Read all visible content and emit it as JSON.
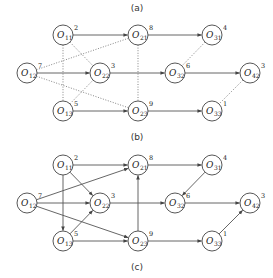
{
  "captions": {
    "a": "(a)",
    "b": "(b)",
    "c": "(c)"
  },
  "nodes": [
    {
      "id": "O11",
      "letter": "O",
      "sub": "11",
      "weight": "2",
      "x": 63,
      "y": 0
    },
    {
      "id": "O12",
      "letter": "O",
      "sub": "12",
      "weight": "7",
      "x": 27,
      "y": 38
    },
    {
      "id": "O13",
      "letter": "O",
      "sub": "13",
      "weight": "5",
      "x": 63,
      "y": 76
    },
    {
      "id": "O21",
      "letter": "O",
      "sub": "21",
      "weight": "8",
      "x": 138,
      "y": 0
    },
    {
      "id": "O22",
      "letter": "O",
      "sub": "22",
      "weight": "3",
      "x": 100,
      "y": 38
    },
    {
      "id": "O23",
      "letter": "O",
      "sub": "23",
      "weight": "9",
      "x": 138,
      "y": 76
    },
    {
      "id": "O31",
      "letter": "O",
      "sub": "31",
      "weight": "4",
      "x": 212,
      "y": 0
    },
    {
      "id": "O32",
      "letter": "O",
      "sub": "32",
      "weight": "6",
      "x": 175,
      "y": 38
    },
    {
      "id": "O33",
      "letter": "O",
      "sub": "33",
      "weight": "1",
      "x": 212,
      "y": 76
    },
    {
      "id": "O42",
      "letter": "O",
      "sub": "42",
      "weight": "3",
      "x": 250,
      "y": 38
    }
  ],
  "diagram_b": {
    "solid_edges": [
      [
        "O11",
        "O21"
      ],
      [
        "O21",
        "O31"
      ],
      [
        "O12",
        "O22"
      ],
      [
        "O22",
        "O32"
      ],
      [
        "O32",
        "O42"
      ],
      [
        "O13",
        "O23"
      ],
      [
        "O23",
        "O33"
      ]
    ],
    "dotted_edges": [
      [
        "O11",
        "O13"
      ],
      [
        "O11",
        "O22"
      ],
      [
        "O12",
        "O21"
      ],
      [
        "O12",
        "O23"
      ],
      [
        "O13",
        "O22"
      ],
      [
        "O21",
        "O23"
      ],
      [
        "O31",
        "O32"
      ],
      [
        "O42",
        "O33"
      ]
    ]
  },
  "diagram_c": {
    "solid_edges": [
      [
        "O11",
        "O21"
      ],
      [
        "O11",
        "O22"
      ],
      [
        "O11",
        "O13"
      ],
      [
        "O12",
        "O21"
      ],
      [
        "O12",
        "O22"
      ],
      [
        "O12",
        "O23"
      ],
      [
        "O13",
        "O22"
      ],
      [
        "O13",
        "O23"
      ],
      [
        "O23",
        "O21"
      ],
      [
        "O21",
        "O31"
      ],
      [
        "O31",
        "O32"
      ],
      [
        "O22",
        "O32"
      ],
      [
        "O32",
        "O42"
      ],
      [
        "O23",
        "O33"
      ],
      [
        "O33",
        "O42"
      ]
    ]
  }
}
